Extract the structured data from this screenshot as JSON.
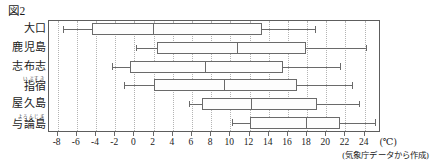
{
  "figure": {
    "caption": "図2",
    "source_note": "(気象庁データから作成)",
    "axis_unit": "(℃)"
  },
  "chart_data": {
    "type": "box",
    "title": "図2",
    "xlabel": "(℃)",
    "ylabel": "",
    "xlim": [
      -8.9,
      25.7
    ],
    "xticks": [
      -8,
      -6,
      -4,
      -2,
      0,
      2,
      4,
      6,
      8,
      10,
      12,
      14,
      16,
      18,
      20,
      22,
      24
    ],
    "xtick_labels": [
      "-8",
      "-6",
      "-4",
      "-2",
      "0",
      "2",
      "4",
      "6",
      "8",
      "10",
      "12",
      "14",
      "16",
      "18",
      "20",
      "22",
      "24"
    ],
    "grid": true,
    "legend": "none",
    "categories": [
      "大口",
      "鹿児島",
      "志布志",
      "指宿",
      "屋久島",
      "与論島"
    ],
    "category_ruby": [
      "",
      "",
      "",
      "いぶすき",
      "",
      "よろんじま"
    ],
    "series": [
      {
        "name": "大口",
        "ruby": "",
        "min": -7.3,
        "q1": -4.3,
        "median": 2.0,
        "q3": 13.4,
        "max": 18.9
      },
      {
        "name": "鹿児島",
        "ruby": "",
        "min": 0.3,
        "q1": 2.5,
        "median": 10.8,
        "q3": 18.0,
        "max": 24.2
      },
      {
        "name": "志布志",
        "ruby": "",
        "min": -2.2,
        "q1": -0.4,
        "median": 7.5,
        "q3": 15.6,
        "max": 21.5
      },
      {
        "name": "指宿",
        "ruby": "いぶすき",
        "min": -1.0,
        "q1": 2.1,
        "median": 9.4,
        "q3": 17.0,
        "max": 22.8
      },
      {
        "name": "屋久島",
        "ruby": "",
        "min": 5.8,
        "q1": 7.2,
        "median": 12.3,
        "q3": 19.1,
        "max": 23.5
      },
      {
        "name": "与論島",
        "ruby": "よろんじま",
        "min": 10.3,
        "q1": 12.2,
        "median": 18.0,
        "q3": 21.5,
        "max": 25.2
      }
    ]
  },
  "colors": {
    "line": "#6a6a6a",
    "frame": "#5d5d5d",
    "grid": "#b4b4b4",
    "text": "#1a1a1a",
    "background": "#ffffff"
  }
}
